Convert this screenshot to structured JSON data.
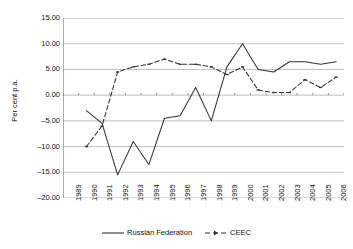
{
  "chart_data": {
    "type": "line",
    "title": "",
    "xlabel": "",
    "ylabel": "Per cent p.a.",
    "ylim": [
      -20.0,
      15.0
    ],
    "ytick_values": [
      15.0,
      10.0,
      5.0,
      0.0,
      -5.0,
      -10.0,
      -15.0,
      -20.0
    ],
    "ytick_labels": [
      "15.00",
      "10.00",
      "5.00",
      "0.00",
      "-5.00",
      "-10.00",
      "-15.00",
      "-20.00"
    ],
    "grid": "horizontal",
    "legend_position": "bottom-center",
    "categories": [
      1989,
      1990,
      1991,
      1992,
      1993,
      1994,
      1995,
      1996,
      1997,
      1998,
      1999,
      2000,
      2001,
      2002,
      2003,
      2004,
      2005,
      2006
    ],
    "xtick_labels": [
      "1989",
      "1990",
      "1991",
      "1992",
      "1993",
      "1994",
      "1995",
      "1996",
      "1997",
      "1998",
      "1999",
      "2000",
      "2001",
      "2002",
      "2003",
      "2004",
      "2005",
      "2006"
    ],
    "series": [
      {
        "name": "Russian Federation",
        "style": "solid",
        "marker": "none",
        "color": "#333333",
        "x": [
          1990,
          1991,
          1992,
          1993,
          1994,
          1995,
          1996,
          1997,
          1998,
          1999,
          2000,
          2001,
          2002,
          2003,
          2004,
          2005,
          2006
        ],
        "values": [
          -3.0,
          -5.5,
          -15.5,
          -9.0,
          -13.5,
          -4.5,
          -4.0,
          1.5,
          -5.0,
          5.5,
          10.0,
          5.0,
          4.5,
          6.5,
          6.5,
          6.0,
          6.5
        ]
      },
      {
        "name": "CEEC",
        "style": "dashed",
        "marker": "dash",
        "color": "#333333",
        "x": [
          1990,
          1991,
          1992,
          1993,
          1994,
          1995,
          1996,
          1997,
          1998,
          1999,
          2000,
          2001,
          2002,
          2003,
          2004,
          2005,
          2006
        ],
        "values": [
          -10.0,
          -6.0,
          4.5,
          5.5,
          6.0,
          7.0,
          6.0,
          6.0,
          5.5,
          4.0,
          5.5,
          1.0,
          0.5,
          0.5,
          3.0,
          1.5,
          3.5
        ]
      }
    ]
  },
  "legend": {
    "items": [
      {
        "label": "Russian Federation"
      },
      {
        "label": "CEEC"
      }
    ]
  }
}
